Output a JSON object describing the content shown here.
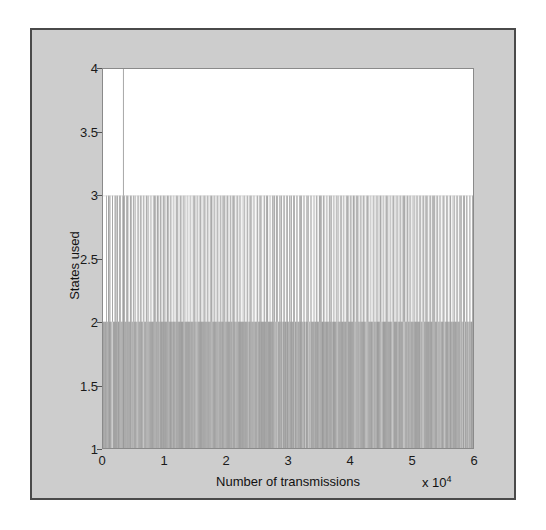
{
  "figure": {
    "background_color": "#cdcdcd",
    "border_color": "#4a4a4a",
    "plot_background_color": "#ffffff",
    "line_color": "#a9a9a9"
  },
  "axis": {
    "x_exponent_prefix": "x 10",
    "x_exponent_value": "4"
  },
  "chart_data": {
    "type": "line",
    "title": "",
    "subtitle": "",
    "xlabel": "Number of transmissions",
    "ylabel": "States used",
    "xlim": [
      0,
      60000
    ],
    "ylim": [
      1,
      4
    ],
    "x_tick_values": [
      0,
      10000,
      20000,
      30000,
      40000,
      50000,
      60000
    ],
    "x_tick_labels": [
      "0",
      "1",
      "2",
      "3",
      "4",
      "5",
      "6"
    ],
    "x_tick_multiplier": "x 10^4",
    "y_tick_values": [
      1,
      1.5,
      2,
      2.5,
      3,
      3.5,
      4
    ],
    "y_tick_labels": [
      "1",
      "1.5",
      "2",
      "2.5",
      "3",
      "3.5",
      "4"
    ],
    "grid": false,
    "legend": null,
    "legend_position": "none",
    "annotations": [],
    "series": [
      {
        "name": "states used per transmission",
        "description": "Step/impulse trace of number of states used; baseline level 1 with dense excursions to 2, frequent spikes to 3, and a single isolated spike reaching 4 near x=3200.",
        "baseline_value": 1,
        "dense_band_upper": 2,
        "spike_band_upper": 3,
        "max_value": 4,
        "max_value_x": 3200,
        "spike_to_3_count": 212,
        "dense_to_2_fill_fraction": 0.93,
        "spikes_to_3_x": [
          560,
          760,
          1000,
          1180,
          1420,
          1700,
          1880,
          2060,
          2300,
          2520,
          2760,
          3000,
          3200,
          3420,
          3660,
          3900,
          4100,
          4320,
          4560,
          4800,
          5020,
          5240,
          5480,
          5700,
          5940,
          6180,
          6400,
          6620,
          6860,
          7100,
          7320,
          7540,
          7780,
          8020,
          8240,
          8460,
          8700,
          8940,
          9160,
          9380,
          9620,
          9860,
          10080,
          10300,
          10540,
          10780,
          11000,
          11220,
          11460,
          11700,
          11920,
          12140,
          12380,
          12620,
          12840,
          13060,
          13300,
          13540,
          13760,
          13980,
          14220,
          14460,
          14680,
          14900,
          15140,
          15380,
          15600,
          15820,
          16060,
          16300,
          16520,
          16740,
          16980,
          17220,
          17440,
          17660,
          17900,
          18140,
          18360,
          18580,
          18820,
          19060,
          19280,
          19500,
          19740,
          19980,
          20200,
          20420,
          20660,
          20900,
          21120,
          21340,
          21580,
          21820,
          22040,
          22260,
          22500,
          22740,
          22960,
          23180,
          23420,
          23660,
          23880,
          24100,
          24340,
          24580,
          24800,
          25020,
          25260,
          25500,
          25720,
          25940,
          26180,
          26420,
          26640,
          26860,
          27100,
          27340,
          27560,
          27780,
          28020,
          28260,
          28480,
          28700,
          28940,
          29180,
          29400,
          29620,
          29860,
          30100,
          30320,
          30540,
          30780,
          31020,
          31240,
          31460,
          31700,
          31940,
          32160,
          32380,
          32620,
          32860,
          33080,
          33300,
          33540,
          33780,
          34000,
          34220,
          34460,
          34700,
          34920,
          35140,
          35380,
          35620,
          35840,
          36060,
          36300,
          36540,
          36760,
          36980,
          37220,
          37460,
          37680,
          37900,
          38140,
          38380,
          38600,
          38820,
          39060,
          39300,
          39520,
          39740,
          39980,
          40220,
          40440,
          40660,
          40900,
          41140,
          41360,
          41580,
          41820,
          42060,
          42280,
          42500,
          42740,
          42980,
          43200,
          43420,
          43660,
          43900,
          44120,
          44340,
          44580,
          44820,
          45040,
          45260,
          45500,
          45740,
          45960,
          46180,
          46420,
          46660,
          46880,
          47100,
          47340,
          47580,
          47800,
          48020,
          48260,
          48500,
          48720,
          48940,
          49180,
          49420,
          49640,
          49860,
          50100,
          50340,
          50560,
          50780,
          51020,
          51260,
          51480,
          51700,
          51940,
          52180,
          52400,
          52620,
          52860,
          53100,
          53320,
          53540,
          53780,
          54020,
          54240,
          54460,
          54700,
          54940,
          55160,
          55380,
          55620,
          55860,
          56080,
          56300,
          56540,
          56780,
          57000,
          57220,
          57460,
          57700,
          57920,
          58140,
          58380,
          58620,
          58840,
          59060,
          59300,
          59540,
          59760
        ]
      }
    ]
  }
}
